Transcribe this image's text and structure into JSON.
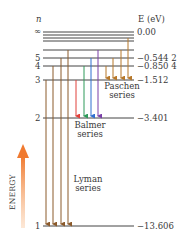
{
  "axis": {
    "n_label": "n",
    "e_label": "E (eV)",
    "energy_label": "ENERGY",
    "energy_arrow_color": "#f07a30"
  },
  "levels": [
    {
      "n": "∞",
      "energy": "0.00",
      "y": 32
    },
    {
      "n": "5",
      "energy": "−0.544 2",
      "y": 58
    },
    {
      "n": "4",
      "energy": "−0.850 4",
      "y": 66
    },
    {
      "n": "3",
      "energy": "−1.512",
      "y": 80
    },
    {
      "n": "2",
      "energy": "−3.401",
      "y": 118
    },
    {
      "n": "1",
      "energy": "−13.606",
      "y": 226
    }
  ],
  "series": {
    "lyman": {
      "name": "Lyman",
      "suffix": "series",
      "color": "#8b5a2b"
    },
    "balmer": {
      "name": "Balmer",
      "suffix": "series",
      "colors": [
        "#e0403a",
        "#2e9a5a",
        "#2f6fd0",
        "#7a3fa8"
      ]
    },
    "paschen": {
      "name": "Paschen",
      "suffix": "series",
      "color": "#b7782a"
    }
  }
}
